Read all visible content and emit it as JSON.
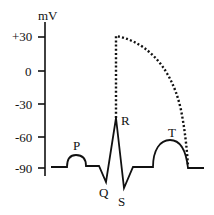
{
  "diagram": {
    "axis": {
      "unit_label": "mV",
      "ticks": [
        {
          "label": "+30",
          "value": 30,
          "y": 37
        },
        {
          "label": "0",
          "value": 0,
          "y": 71
        },
        {
          "label": "-30",
          "value": -30,
          "y": 104
        },
        {
          "label": "-60",
          "value": -60,
          "y": 137
        },
        {
          "label": "-90",
          "value": -90,
          "y": 168
        }
      ]
    },
    "waves": {
      "P": "P",
      "Q": "Q",
      "R": "R",
      "S": "S",
      "T": "T"
    },
    "colors": {
      "line": "#111111",
      "background": "#ffffff"
    }
  }
}
